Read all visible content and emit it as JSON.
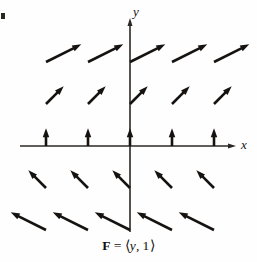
{
  "figure": {
    "name": "vector-field-plot",
    "caption": {
      "field_symbol": "F",
      "equals": "=",
      "open_bracket": "⟨",
      "component_x": "y",
      "comma": ",",
      "component_y": "1",
      "close_bracket": "⟩",
      "full_text": "F = ⟨y, 1⟩"
    },
    "axes": {
      "x_label": "x",
      "y_label": "y",
      "origin_px": {
        "x": 130,
        "y": 146
      },
      "x_axis_start_px": 20,
      "x_axis_end_px": 236,
      "y_axis_top_px": 18,
      "y_axis_bottom_px": 232,
      "grid_spacing_px": 42,
      "color": "#2b2724",
      "line_width": 1.6
    },
    "style": {
      "background": "#fefefe",
      "arrow_color": "#151210",
      "arrow_line_width": 2.6,
      "arrowhead_length": 9,
      "arrowhead_width": 6.5
    }
  },
  "chart_data": {
    "type": "quiver",
    "xlabel": "x",
    "ylabel": "y",
    "grid": false,
    "legend": false,
    "xlim": [
      -2.6,
      2.6
    ],
    "ylim": [
      -2.6,
      2.6
    ],
    "formula": "F(x, y) = <y, 1>",
    "x_values": [
      -2,
      -1,
      0,
      1,
      2
    ],
    "y_values": [
      2,
      1,
      0,
      -1,
      -2
    ],
    "scale": 0.42,
    "vectors": [
      {
        "x": -2,
        "y": 2,
        "u": 2,
        "v": 1,
        "angle_deg": 26.6,
        "row": "y=2"
      },
      {
        "x": -1,
        "y": 2,
        "u": 2,
        "v": 1,
        "angle_deg": 26.6,
        "row": "y=2"
      },
      {
        "x": 0,
        "y": 2,
        "u": 2,
        "v": 1,
        "angle_deg": 26.6,
        "row": "y=2"
      },
      {
        "x": 1,
        "y": 2,
        "u": 2,
        "v": 1,
        "angle_deg": 26.6,
        "row": "y=2"
      },
      {
        "x": 2,
        "y": 2,
        "u": 2,
        "v": 1,
        "angle_deg": 26.6,
        "row": "y=2"
      },
      {
        "x": -2,
        "y": 1,
        "u": 1,
        "v": 1,
        "angle_deg": 45.0,
        "row": "y=1"
      },
      {
        "x": -1,
        "y": 1,
        "u": 1,
        "v": 1,
        "angle_deg": 45.0,
        "row": "y=1"
      },
      {
        "x": 0,
        "y": 1,
        "u": 1,
        "v": 1,
        "angle_deg": 45.0,
        "row": "y=1"
      },
      {
        "x": 1,
        "y": 1,
        "u": 1,
        "v": 1,
        "angle_deg": 45.0,
        "row": "y=1"
      },
      {
        "x": 2,
        "y": 1,
        "u": 1,
        "v": 1,
        "angle_deg": 45.0,
        "row": "y=1"
      },
      {
        "x": -2,
        "y": 0,
        "u": 0,
        "v": 1,
        "angle_deg": 90.0,
        "row": "y=0"
      },
      {
        "x": -1,
        "y": 0,
        "u": 0,
        "v": 1,
        "angle_deg": 90.0,
        "row": "y=0"
      },
      {
        "x": 0,
        "y": 0,
        "u": 0,
        "v": 1,
        "angle_deg": 90.0,
        "row": "y=0"
      },
      {
        "x": 1,
        "y": 0,
        "u": 0,
        "v": 1,
        "angle_deg": 90.0,
        "row": "y=0"
      },
      {
        "x": 2,
        "y": 0,
        "u": 0,
        "v": 1,
        "angle_deg": 90.0,
        "row": "y=0"
      },
      {
        "x": -2,
        "y": -1,
        "u": -1,
        "v": 1,
        "angle_deg": 135.0,
        "row": "y=-1"
      },
      {
        "x": -1,
        "y": -1,
        "u": -1,
        "v": 1,
        "angle_deg": 135.0,
        "row": "y=-1"
      },
      {
        "x": 0,
        "y": -1,
        "u": -1,
        "v": 1,
        "angle_deg": 135.0,
        "row": "y=-1"
      },
      {
        "x": 1,
        "y": -1,
        "u": -1,
        "v": 1,
        "angle_deg": 135.0,
        "row": "y=-1"
      },
      {
        "x": 2,
        "y": -1,
        "u": -1,
        "v": 1,
        "angle_deg": 135.0,
        "row": "y=-1"
      },
      {
        "x": -2,
        "y": -2,
        "u": -2,
        "v": 1,
        "angle_deg": 153.4,
        "row": "y=-2"
      },
      {
        "x": -1,
        "y": -2,
        "u": -2,
        "v": 1,
        "angle_deg": 153.4,
        "row": "y=-2"
      },
      {
        "x": 0,
        "y": -2,
        "u": -2,
        "v": 1,
        "angle_deg": 153.4,
        "row": "y=-2"
      },
      {
        "x": 1,
        "y": -2,
        "u": -2,
        "v": 1,
        "angle_deg": 153.4,
        "row": "y=-2"
      },
      {
        "x": 2,
        "y": -2,
        "u": -2,
        "v": 1,
        "angle_deg": 153.4,
        "row": "y=-2"
      }
    ]
  }
}
